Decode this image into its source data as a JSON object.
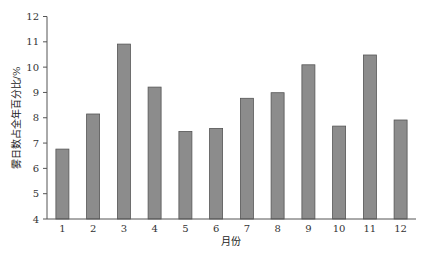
{
  "chart_data": {
    "type": "bar",
    "title": "",
    "xlabel": "月份",
    "ylabel": "雾日数占全年百分比/%",
    "categories": [
      "1",
      "2",
      "3",
      "4",
      "5",
      "6",
      "7",
      "8",
      "9",
      "10",
      "11",
      "12"
    ],
    "values": [
      6.76,
      8.15,
      10.91,
      9.21,
      7.46,
      7.58,
      8.77,
      8.99,
      10.09,
      7.67,
      10.48,
      7.91
    ],
    "ylim": [
      4,
      12
    ],
    "yticks": [
      4,
      5,
      6,
      7,
      8,
      9,
      10,
      11,
      12
    ],
    "grid": false,
    "legend": null,
    "colors": {
      "bar_fill": "#8c8c8c",
      "bar_stroke": "#555555"
    }
  }
}
